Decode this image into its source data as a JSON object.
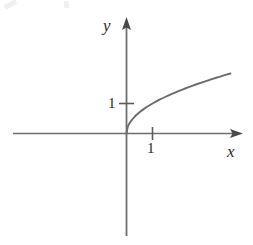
{
  "figure": {
    "kind": "math-function-graph",
    "background_color": "#ffffff",
    "line_color": "#6b6b6b",
    "axis_color": "#6e6e6e",
    "text_color": "#2b2b2b"
  },
  "labels": {
    "y_axis": "y",
    "x_axis": "x",
    "y_tick_1": "1",
    "x_tick_1": "1"
  },
  "chart_data": {
    "type": "line",
    "title": "",
    "xlabel": "x",
    "ylabel": "y",
    "xlim": [
      -4.3,
      4.5
    ],
    "ylim": [
      -3.4,
      3.9
    ],
    "grid": false,
    "legend": null,
    "axis_ticks": {
      "x": [
        1
      ],
      "y": [
        1
      ]
    },
    "x_tick_labels": [
      "1"
    ],
    "y_tick_labels": [
      "1"
    ],
    "series": [
      {
        "name": "y = sqrt(x)",
        "expression": "sqrt(x)",
        "x": [
          0,
          0.05,
          0.1,
          0.2,
          0.3,
          0.4,
          0.5,
          0.7,
          0.9,
          1.0,
          1.25,
          1.5,
          1.75,
          2.0,
          2.25,
          2.5,
          2.75,
          3.0,
          3.25,
          3.5,
          3.75,
          4.0
        ],
        "y": [
          0,
          0.224,
          0.316,
          0.447,
          0.548,
          0.632,
          0.707,
          0.837,
          0.949,
          1.0,
          1.118,
          1.225,
          1.323,
          1.414,
          1.5,
          1.581,
          1.658,
          1.732,
          1.803,
          1.871,
          1.936,
          2.0
        ]
      }
    ],
    "annotations": [
      {
        "text": "1",
        "axis": "y",
        "value": 1
      },
      {
        "text": "1",
        "axis": "x",
        "value": 1
      }
    ]
  }
}
